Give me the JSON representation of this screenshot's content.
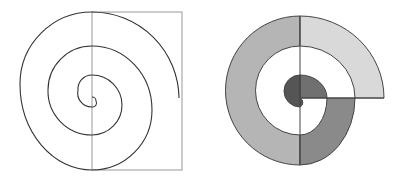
{
  "figure": {
    "width": 403,
    "height": 180,
    "background": "#ffffff",
    "left_panel": {
      "description": "Archimedean spiral line drawing with bounding rectangle",
      "rectangle": {
        "x": 92,
        "y": 12,
        "w": 90,
        "h": 158,
        "stroke": "#999999"
      },
      "spiral_stroke": "#333333",
      "spiral_path": "M 179 98 A 87 87 0 0 0 92 12 A 72 72 0 0 0 20 84 A 72 86 0 0 0 92 170 A 60 60 0 0 0 152 110 A 60 64 0 0 0 92 46 A 44 44 0 0 0 48 90 A 44 44 0 0 0 92 135 A 30 30 0 0 0 122 105 A 30 30 0 0 0 92 75 A 14 14 0 0 0 78 90 A 14 14 0 0 0 92 107 A 4 4 0 0 0 96 101 A 4 4 0 0 0 92 97"
    },
    "right_panel": {
      "description": "Spiral composed of shaded half-annulus and quarter-annulus segments",
      "stroke": "#444444",
      "segments": [
        {
          "name": "outer-left-half",
          "fill": "#b5b5b5",
          "path": "M 300 16 A 74 74 0 0 0 300 165 L 300 135 A 44 44 0 0 1 300 46 Z"
        },
        {
          "name": "outer-top-right-quarter",
          "fill": "#d9d9d9",
          "path": "M 300 16 A 84 82 0 0 1 384 98 L 355 98 A 55 52 0 0 0 300 46 Z"
        },
        {
          "name": "mid-bottom-right-quarter",
          "fill": "#8a8a8a",
          "path": "M 355 98 A 55 67 0 0 1 300 165 L 300 135 A 27 37 0 0 0 327 98 Z"
        },
        {
          "name": "inner-top-right-quarter",
          "fill": "#707070",
          "path": "M 300 75 A 27 23 0 0 1 327 98 L 300 98 Z"
        },
        {
          "name": "inner-left-half",
          "fill": "#555555",
          "path": "M 300 75 A 16 16 0 0 0 300 107 A 5 5 0 0 0 300 98 Z"
        }
      ],
      "divider_vertical": {
        "x1": 300,
        "y1": 16,
        "x2": 300,
        "y2": 165
      },
      "divider_horizontal": {
        "x1": 300,
        "y1": 98,
        "x2": 384,
        "y2": 98
      }
    }
  }
}
